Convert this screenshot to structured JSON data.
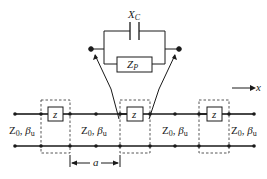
{
  "diagram": {
    "inset": {
      "capacitor_label": "X",
      "capacitor_sub": "C",
      "impedance_label": "Z",
      "impedance_sub": "P"
    },
    "line_segments": [
      {
        "z0": "Z",
        "z0_sub": "0",
        "beta": "β",
        "beta_sub": "u"
      },
      {
        "z0": "Z",
        "z0_sub": "0",
        "beta": "β",
        "beta_sub": "u"
      },
      {
        "z0": "Z",
        "z0_sub": "0",
        "beta": "β",
        "beta_sub": "u"
      },
      {
        "z0": "Z",
        "z0_sub": "0",
        "beta": "β",
        "beta_sub": "u"
      }
    ],
    "series_element_label": "z",
    "period_label": "a",
    "axis_label": "x",
    "colors": {
      "line": "#1a1a1a",
      "dashed_box": "#444444"
    }
  }
}
